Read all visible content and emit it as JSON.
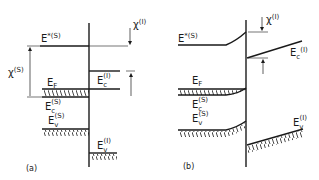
{
  "figure": {
    "panel_a": {
      "caption": "(a)",
      "labels": {
        "e_star_s": {
          "base": "E",
          "sup": "*(S)"
        },
        "chi_s": {
          "base": "χ",
          "sup": "(S)"
        },
        "chi_i": {
          "base": "χ",
          "sup": "(I)"
        },
        "e_f": {
          "base": "E",
          "sub": "F"
        },
        "e_c_i": {
          "base": "E",
          "sub": "c",
          "sup": "(I)"
        },
        "e_c_s": {
          "base": "E",
          "sub": "c",
          "sup": "(S)"
        },
        "e_v_s": {
          "base": "E",
          "sub": "v",
          "sup": "(S)"
        },
        "e_v_i": {
          "base": "E",
          "sub": "v",
          "sup": "(I)"
        }
      }
    },
    "panel_b": {
      "caption": "(b)",
      "labels": {
        "e_star_s": {
          "base": "E",
          "sup": "*(S)"
        },
        "chi_i": {
          "base": "χ",
          "sup": "(I)"
        },
        "e_c_i": {
          "base": "E",
          "sub": "c",
          "sup": "(I)"
        },
        "e_f": {
          "base": "E",
          "sub": "F"
        },
        "e_c_s": {
          "base": "E",
          "sub": "c",
          "sup": "(S)"
        },
        "e_v_s": {
          "base": "E",
          "sub": "v",
          "sup": "(S)"
        },
        "e_v_i": {
          "base": "E",
          "sub": "v",
          "sup": "(I)"
        }
      }
    },
    "colors": {
      "ink": "#1a1a1a",
      "background": "#ffffff"
    }
  }
}
